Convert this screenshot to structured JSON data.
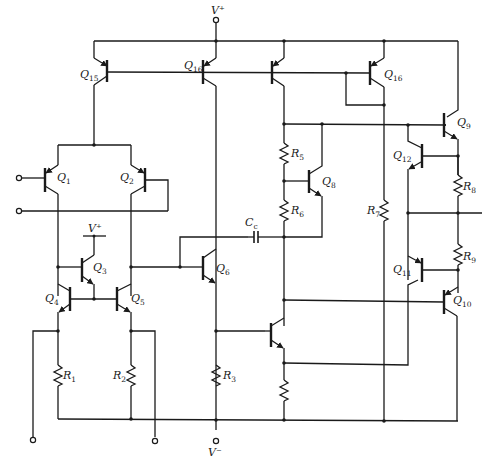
{
  "diagram": {
    "type": "circuit-schematic",
    "supply_labels": {
      "positive": "V⁺",
      "positive_inner": "V⁺",
      "negative": "V⁻"
    },
    "transistors": [
      {
        "id": "Q1",
        "label": "Q",
        "sub": "1"
      },
      {
        "id": "Q2",
        "label": "Q",
        "sub": "2"
      },
      {
        "id": "Q3",
        "label": "Q",
        "sub": "3"
      },
      {
        "id": "Q4",
        "label": "Q",
        "sub": "4"
      },
      {
        "id": "Q5",
        "label": "Q",
        "sub": "5"
      },
      {
        "id": "Q6",
        "label": "Q",
        "sub": "6"
      },
      {
        "id": "Q8",
        "label": "Q",
        "sub": "8"
      },
      {
        "id": "Q9",
        "label": "Q",
        "sub": "9"
      },
      {
        "id": "Q10",
        "label": "Q",
        "sub": "10"
      },
      {
        "id": "Q11",
        "label": "Q",
        "sub": "11"
      },
      {
        "id": "Q12",
        "label": "Q",
        "sub": "12"
      },
      {
        "id": "Q13",
        "label": "Q",
        "sub": "13"
      },
      {
        "id": "Q14",
        "label": "Q",
        "sub": "14"
      },
      {
        "id": "Q15",
        "label": "Q",
        "sub": "15"
      },
      {
        "id": "Q16",
        "label": "Q",
        "sub": "16"
      }
    ],
    "resistors": [
      {
        "id": "R1",
        "label": "R",
        "sub": "1"
      },
      {
        "id": "R2",
        "label": "R",
        "sub": "2"
      },
      {
        "id": "R3",
        "label": "R",
        "sub": "3"
      },
      {
        "id": "R5",
        "label": "R",
        "sub": "5"
      },
      {
        "id": "R6",
        "label": "R",
        "sub": "6"
      },
      {
        "id": "R7",
        "label": "R",
        "sub": "7"
      },
      {
        "id": "R8",
        "label": "R",
        "sub": "8"
      },
      {
        "id": "R9",
        "label": "R",
        "sub": "9"
      }
    ],
    "capacitors": [
      {
        "id": "Cc",
        "label": "C",
        "sub": "c"
      }
    ]
  }
}
